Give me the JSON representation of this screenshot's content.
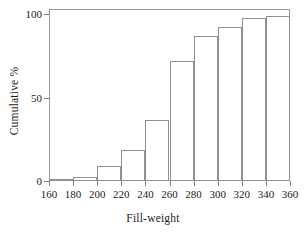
{
  "chart_data": {
    "type": "bar",
    "title": "",
    "subtitle": "",
    "xlabel": "Fill-weight",
    "ylabel": "Cumulative %",
    "xlim": [
      160,
      360
    ],
    "ylim": [
      0,
      103
    ],
    "grid": false,
    "legend": null,
    "bin_width": 20,
    "bin_edges": [
      160,
      180,
      200,
      220,
      240,
      260,
      280,
      300,
      320,
      340,
      360
    ],
    "categories": [
      "160-180",
      "180-200",
      "200-220",
      "220-240",
      "240-260",
      "260-280",
      "280-300",
      "300-320",
      "320-340",
      "340-360"
    ],
    "values": [
      0.6,
      2.5,
      9.0,
      18.7,
      36.7,
      71.7,
      86.7,
      92.2,
      97.6,
      98.8
    ],
    "xticks": [
      160,
      180,
      200,
      220,
      240,
      260,
      280,
      300,
      320,
      340,
      360
    ],
    "xticklabels": [
      "160",
      "180",
      "200",
      "220",
      "240",
      "260",
      "280",
      "300",
      "320",
      "340",
      "360"
    ],
    "yticks": [
      0,
      50,
      100
    ],
    "yticklabels": [
      "0",
      "50",
      "100"
    ],
    "colors": {
      "bar_edge": "#8f8f8f",
      "bar_fill": "none",
      "frame": "#9a9a9a",
      "tick": "#7d7d7d",
      "text": "#1c1c1c",
      "background": "#ffffff"
    }
  }
}
